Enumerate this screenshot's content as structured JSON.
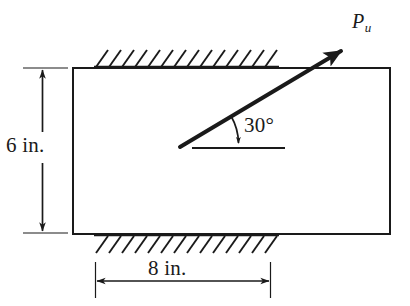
{
  "figure": {
    "background_color": "#ffffff",
    "line_color": "#1a1a1a"
  },
  "plate": {
    "name": "rectangular-plate",
    "width_in": 8,
    "height_in": 6,
    "x": 73,
    "y": 68,
    "w": 317,
    "h": 166,
    "stroke_width": 2.0
  },
  "supports": [
    {
      "name": "top-support-hatching",
      "edge": "top",
      "x_start": 95,
      "x_end": 278,
      "y": 67,
      "hatch_count": 14,
      "slant": "up-right"
    },
    {
      "name": "bottom-support-hatching",
      "edge": "bottom",
      "x_start": 95,
      "x_end": 278,
      "y": 235,
      "hatch_count": 14,
      "slant": "up-right"
    }
  ],
  "force": {
    "name": "applied-load-arrow",
    "label": "P",
    "subscript": "u",
    "angle_deg": 30,
    "angle_label": "30°",
    "tail_x": 180,
    "tail_y": 147,
    "tip_x": 345,
    "tip_y": 48,
    "stroke_width": 4.0
  },
  "angle_marker": {
    "name": "angle-arc",
    "reference_line": {
      "x_start": 192,
      "x_end": 285,
      "y": 148
    },
    "arc_label": "30°"
  },
  "dimensions": [
    {
      "name": "height-dimension",
      "label": "6 in.",
      "value": 6,
      "unit": "in.",
      "orientation": "vertical",
      "x": 42,
      "y_start": 68,
      "y_end": 233
    },
    {
      "name": "width-dimension",
      "label": "8 in.",
      "value": 8,
      "unit": "in.",
      "orientation": "horizontal",
      "y": 281,
      "x_start": 95,
      "x_end": 270
    }
  ]
}
